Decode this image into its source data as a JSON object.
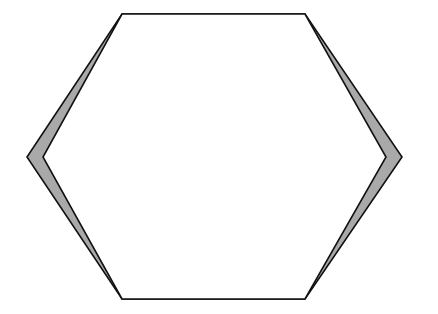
{
  "diagram": {
    "type": "hexagon-with-edge-slivers",
    "canvas": {
      "width": 438,
      "height": 314
    },
    "colors": {
      "background": "#ffffff",
      "stroke": "#111111",
      "sliver_fill": "#a9a9a9",
      "interior_fill": "#ffffff"
    },
    "outer_polygon": [
      [
        122,
        14
      ],
      [
        305,
        14
      ],
      [
        402,
        157
      ],
      [
        305,
        299
      ],
      [
        122,
        299
      ],
      [
        27,
        157
      ]
    ],
    "inner_polygon": [
      [
        122,
        14
      ],
      [
        305,
        14
      ],
      [
        386,
        157
      ],
      [
        305,
        299
      ],
      [
        122,
        299
      ],
      [
        43,
        157
      ]
    ],
    "stroke_width": 1.6
  }
}
